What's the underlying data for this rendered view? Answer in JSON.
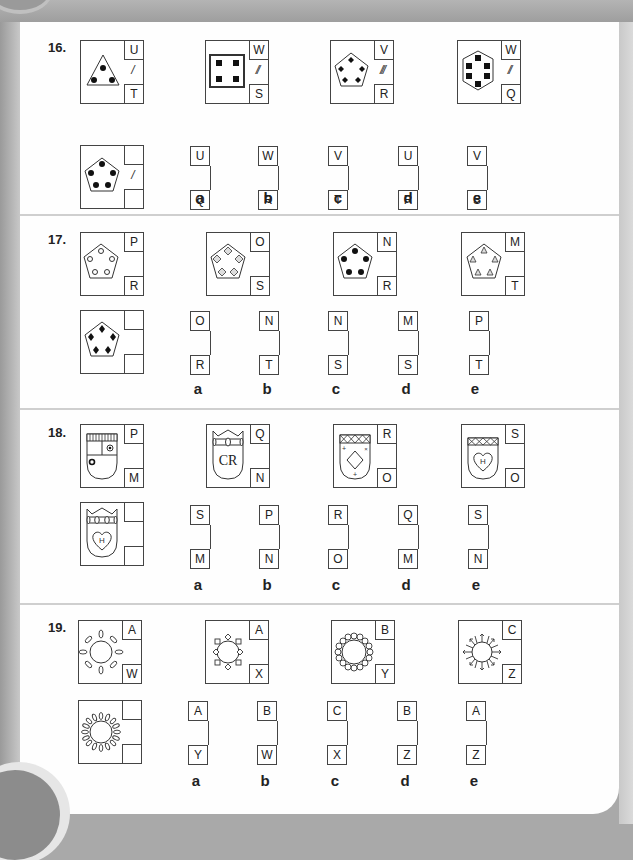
{
  "questions": [
    {
      "number": "16.",
      "figures": [
        {
          "shape": "triangle",
          "dots": "circles",
          "top": "U",
          "mark": "/",
          "bottom": "T"
        },
        {
          "shape": "square",
          "dots": "squares",
          "top": "W",
          "mark": "//",
          "bottom": "S"
        },
        {
          "shape": "pentagon",
          "dots": "diamonds",
          "top": "V",
          "mark": "///",
          "bottom": "R"
        },
        {
          "shape": "hexagon",
          "dots": "squares",
          "top": "W",
          "mark": "//",
          "bottom": "Q"
        }
      ],
      "target": {
        "shape": "pentagon",
        "dots": "circles",
        "mark": "/",
        "top": "",
        "bottom": ""
      },
      "options": [
        {
          "label": "a",
          "top": "U",
          "bottom": "Q"
        },
        {
          "label": "b",
          "top": "W",
          "bottom": "R"
        },
        {
          "label": "c",
          "top": "V",
          "bottom": "T"
        },
        {
          "label": "d",
          "top": "U",
          "bottom": "R"
        },
        {
          "label": "e",
          "top": "V",
          "bottom": "S"
        }
      ]
    },
    {
      "number": "17.",
      "figures": [
        {
          "shape": "pentagon",
          "dots": "open-circles",
          "top": "P",
          "bottom": "R"
        },
        {
          "shape": "pentagon",
          "dots": "hatched-diamonds",
          "top": "O",
          "bottom": "S"
        },
        {
          "shape": "pentagon",
          "dots": "circles",
          "top": "N",
          "bottom": "R"
        },
        {
          "shape": "pentagon",
          "dots": "hatched-triangles",
          "top": "M",
          "bottom": "T"
        }
      ],
      "target": {
        "shape": "pentagon",
        "dots": "diamonds",
        "top": "",
        "bottom": ""
      },
      "options": [
        {
          "label": "a",
          "top": "O",
          "bottom": "R"
        },
        {
          "label": "b",
          "top": "N",
          "bottom": "T"
        },
        {
          "label": "c",
          "top": "N",
          "bottom": "S"
        },
        {
          "label": "d",
          "top": "M",
          "bottom": "S"
        },
        {
          "label": "e",
          "top": "P",
          "bottom": "T"
        }
      ]
    },
    {
      "number": "18.",
      "figures": [
        {
          "shape": "shield",
          "header": "striped",
          "emblem": "quartered-circles",
          "top": "P",
          "bottom": "M"
        },
        {
          "shape": "shield",
          "header": "crown",
          "emblem": "CR",
          "top": "Q",
          "bottom": "N"
        },
        {
          "shape": "shield",
          "header": "crosses",
          "emblem": "diamond",
          "top": "R",
          "bottom": "O"
        },
        {
          "shape": "shield",
          "header": "crosses",
          "emblem": "heart",
          "heart_letter": "H",
          "top": "S",
          "bottom": "O"
        }
      ],
      "target": {
        "shape": "shield",
        "header": "crown",
        "emblem": "heart",
        "heart_letter": "H",
        "top": "",
        "bottom": ""
      },
      "options": [
        {
          "label": "a",
          "top": "S",
          "bottom": "M"
        },
        {
          "label": "b",
          "top": "P",
          "bottom": "N"
        },
        {
          "label": "c",
          "top": "R",
          "bottom": "O"
        },
        {
          "label": "d",
          "top": "Q",
          "bottom": "M"
        },
        {
          "label": "e",
          "top": "S",
          "bottom": "N"
        }
      ]
    },
    {
      "number": "19.",
      "figures": [
        {
          "shape": "sun",
          "rays": "8-petals",
          "top": "A",
          "bottom": "W"
        },
        {
          "shape": "sun",
          "rays": "8-squares-diamonds",
          "top": "A",
          "bottom": "X"
        },
        {
          "shape": "sun",
          "rays": "16-circles",
          "top": "B",
          "bottom": "Y"
        },
        {
          "shape": "sun",
          "rays": "16-arrows",
          "top": "C",
          "bottom": "Z"
        }
      ],
      "target": {
        "shape": "sun",
        "rays": "16-petals",
        "top": "",
        "bottom": ""
      },
      "options": [
        {
          "label": "a",
          "top": "A",
          "bottom": "Y"
        },
        {
          "label": "b",
          "top": "B",
          "bottom": "W"
        },
        {
          "label": "c",
          "top": "C",
          "bottom": "X"
        },
        {
          "label": "d",
          "top": "B",
          "bottom": "Z"
        },
        {
          "label": "e",
          "top": "A",
          "bottom": "Z"
        }
      ]
    }
  ]
}
